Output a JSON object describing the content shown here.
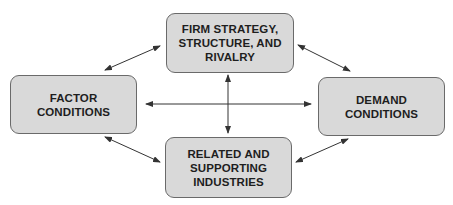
{
  "diagram": {
    "title": "",
    "colors": {
      "box_fill": "#d9d9d9",
      "box_border": "#6a6a6a",
      "arrow": "#333333",
      "text": "#1e1e1e"
    },
    "nodes": {
      "top": {
        "label": "FIRM STRATEGY,\nSTRUCTURE, AND\nRIVALRY"
      },
      "left": {
        "label": "FACTOR\nCONDITIONS"
      },
      "right": {
        "label": "DEMAND\nCONDITIONS"
      },
      "bottom": {
        "label": "RELATED AND\nSUPPORTING\nINDUSTRIES"
      }
    },
    "edges": [
      {
        "from": "left",
        "to": "top",
        "type": "bidirectional"
      },
      {
        "from": "top",
        "to": "right",
        "type": "bidirectional"
      },
      {
        "from": "left",
        "to": "bottom",
        "type": "bidirectional"
      },
      {
        "from": "bottom",
        "to": "right",
        "type": "bidirectional"
      },
      {
        "from": "left",
        "to": "right",
        "type": "bidirectional"
      },
      {
        "from": "top",
        "to": "bottom",
        "type": "bidirectional"
      }
    ]
  }
}
